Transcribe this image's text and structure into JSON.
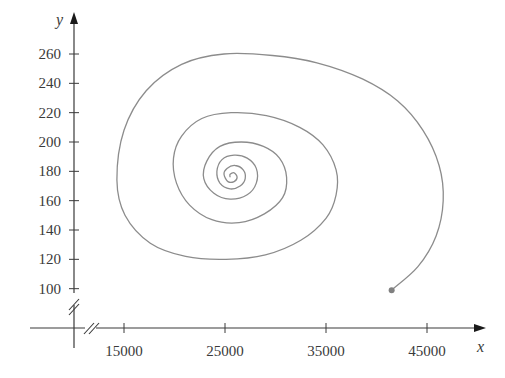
{
  "chart_data": {
    "type": "line",
    "title": "",
    "xlabel": "x",
    "ylabel": "y",
    "xlim": [
      9500,
      48500
    ],
    "ylim": [
      80,
      275
    ],
    "axis_breaks": {
      "x": true,
      "y": true
    },
    "grid": false,
    "legend": null,
    "x_ticks": [
      15000,
      25000,
      35000,
      45000
    ],
    "x_tick_labels": [
      "15000",
      "25000",
      "35000",
      "45000"
    ],
    "y_ticks": [
      100,
      120,
      140,
      160,
      180,
      200,
      220,
      240,
      260
    ],
    "y_tick_labels": [
      "100",
      "120",
      "140",
      "160",
      "180",
      "200",
      "220",
      "240",
      "260"
    ],
    "series": [
      {
        "name": "trajectory",
        "color": "#8c8c8c",
        "start_marker": {
          "x": 41500,
          "y": 99
        },
        "points": [
          [
            41500,
            99
          ],
          [
            44100,
            115
          ],
          [
            45900,
            136
          ],
          [
            46600,
            160
          ],
          [
            46200,
            184
          ],
          [
            44600,
            208
          ],
          [
            42100,
            228
          ],
          [
            38600,
            243
          ],
          [
            34100,
            254
          ],
          [
            29700,
            259
          ],
          [
            24900,
            260
          ],
          [
            20700,
            253
          ],
          [
            17200,
            235
          ],
          [
            15000,
            208
          ],
          [
            14300,
            174
          ],
          [
            15100,
            150
          ],
          [
            17600,
            131
          ],
          [
            21100,
            122
          ],
          [
            25100,
            120
          ],
          [
            29000,
            123
          ],
          [
            32500,
            133
          ],
          [
            35000,
            148
          ],
          [
            36000,
            164
          ],
          [
            36000,
            181
          ],
          [
            34700,
            198
          ],
          [
            32400,
            210
          ],
          [
            29100,
            218
          ],
          [
            25600,
            220
          ],
          [
            22700,
            216
          ],
          [
            20700,
            204
          ],
          [
            19900,
            189
          ],
          [
            20200,
            172
          ],
          [
            21500,
            157
          ],
          [
            23700,
            147
          ],
          [
            26400,
            145
          ],
          [
            28900,
            151
          ],
          [
            30700,
            162
          ],
          [
            31100,
            176
          ],
          [
            30400,
            189
          ],
          [
            28800,
            197
          ],
          [
            26600,
            200
          ],
          [
            24500,
            197
          ],
          [
            23200,
            187
          ],
          [
            22900,
            175
          ],
          [
            23900,
            165
          ],
          [
            25500,
            161
          ],
          [
            27200,
            164
          ],
          [
            28100,
            172
          ],
          [
            28100,
            182
          ],
          [
            27200,
            189
          ],
          [
            25900,
            191
          ],
          [
            24700,
            188
          ],
          [
            24200,
            180
          ],
          [
            24500,
            172
          ],
          [
            25500,
            168
          ],
          [
            26500,
            170
          ],
          [
            27000,
            175
          ],
          [
            26800,
            181
          ],
          [
            26000,
            184
          ],
          [
            25200,
            182
          ],
          [
            24900,
            178
          ],
          [
            25300,
            173
          ],
          [
            25900,
            173
          ],
          [
            26200,
            176
          ],
          [
            25900,
            179
          ],
          [
            25500,
            178
          ],
          [
            25500,
            176
          ]
        ]
      }
    ]
  }
}
